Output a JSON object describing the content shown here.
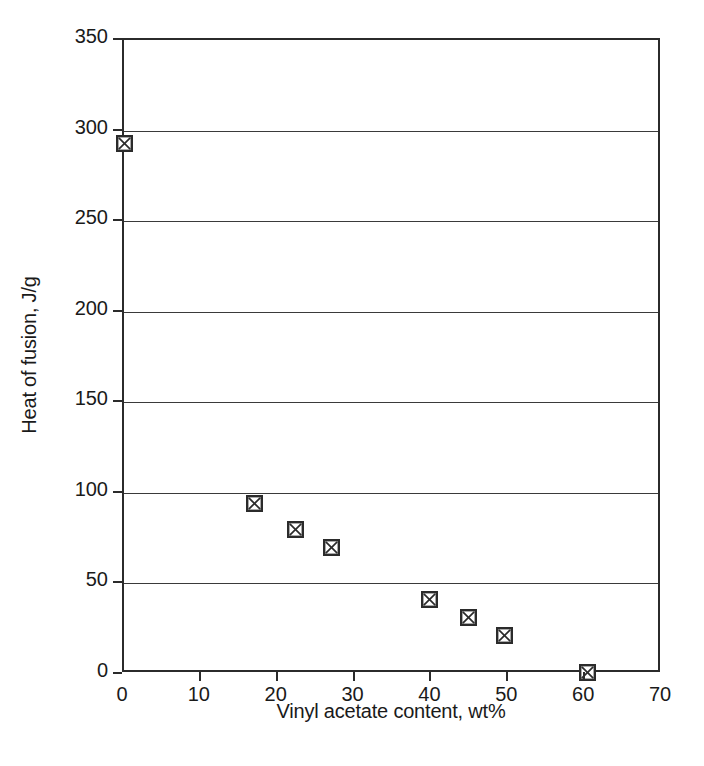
{
  "chart_data": {
    "type": "scatter",
    "title": "",
    "xlabel": "Vinyl acetate content, wt%",
    "ylabel": "Heat of fusion, J/g",
    "xlim": [
      0,
      70
    ],
    "ylim": [
      0,
      350
    ],
    "xticks": [
      0,
      10,
      20,
      30,
      40,
      50,
      60,
      70
    ],
    "yticks": [
      0,
      50,
      100,
      150,
      200,
      250,
      300,
      350
    ],
    "xtick_labels": [
      "0",
      "10",
      "20",
      "30",
      "40",
      "50",
      "60",
      "70"
    ],
    "ytick_labels": [
      "0",
      "50",
      "100",
      "150",
      "200",
      "250",
      "300",
      "350"
    ],
    "grid": "horizontal",
    "legend": "none",
    "marker_style": "crossed-square",
    "marker_color": "#2b2b2b",
    "series": [
      {
        "name": "Heat of fusion vs vinyl acetate content",
        "x": [
          0,
          17,
          22.3,
          27,
          39.8,
          44.8,
          49.5,
          60.3
        ],
        "y": [
          293,
          94,
          80,
          70,
          41,
          31,
          21,
          1
        ]
      }
    ]
  },
  "figure": {
    "background_color": "#ffffff",
    "axis_color": "#2b2b2b",
    "grid_color": "#3a3a3a",
    "text_color": "#1a1a1a"
  }
}
